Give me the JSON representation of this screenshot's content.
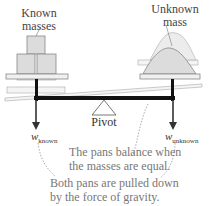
{
  "labels": {
    "known_masses": [
      "Known",
      "masses"
    ],
    "unknown_mass": [
      "Unknown",
      "mass"
    ],
    "pivot": "Pivot",
    "w_known_symbol": "w",
    "w_known_sub": "known",
    "w_unknown_symbol": "w",
    "w_unknown_sub": "unknown"
  },
  "notes": {
    "balance": [
      "The pans balance when",
      "the masses are equal."
    ],
    "gravity": [
      "Both pans are pulled down",
      "by the force of gravity."
    ]
  },
  "colors": {
    "beam": "#111111",
    "pan_fill": "#f0f0f0",
    "pan_stroke": "#888888",
    "mass_fill": "#dcdcdc",
    "text": "#444444",
    "note_text": "#777777"
  }
}
